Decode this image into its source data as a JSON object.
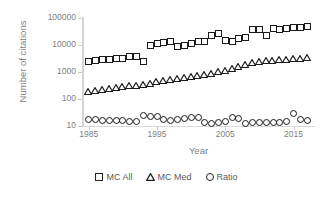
{
  "chart_data": {
    "type": "scatter",
    "title": "",
    "xlabel": "Year",
    "ylabel": "Number of citations",
    "yscale": "log",
    "ylim": [
      10,
      100000
    ],
    "xlim": [
      1984,
      2018
    ],
    "grid": false,
    "legend_position": "bottom",
    "y_ticks": [
      "10",
      "100",
      "1000",
      "10000",
      "100000"
    ],
    "y_tick_values": [
      10,
      100,
      1000,
      10000,
      100000
    ],
    "x_ticks": [
      "1985",
      "1995",
      "2005",
      "2015"
    ],
    "x_tick_values": [
      1985,
      1995,
      2005,
      2015
    ],
    "x": [
      1985,
      1986,
      1987,
      1988,
      1989,
      1990,
      1991,
      1992,
      1993,
      1994,
      1995,
      1996,
      1997,
      1998,
      1999,
      2000,
      2001,
      2002,
      2003,
      2004,
      2005,
      2006,
      2007,
      2008,
      2009,
      2010,
      2011,
      2012,
      2013,
      2014,
      2015,
      2016,
      2017
    ],
    "series": [
      {
        "name": "MC All",
        "marker": "square",
        "values": [
          2400,
          2700,
          2800,
          3000,
          3100,
          3300,
          3600,
          3800,
          2500,
          10000,
          11000,
          12000,
          13000,
          8500,
          9500,
          11000,
          13000,
          14000,
          22000,
          26000,
          15000,
          14000,
          17000,
          19000,
          36000,
          38000,
          23000,
          40000,
          38000,
          42000,
          44000,
          45000,
          48000
        ]
      },
      {
        "name": "MC Med",
        "marker": "triangle",
        "values": [
          140,
          155,
          175,
          185,
          200,
          215,
          235,
          250,
          270,
          300,
          330,
          360,
          400,
          440,
          480,
          520,
          560,
          620,
          700,
          780,
          900,
          1000,
          1200,
          1400,
          1700,
          1900,
          2000,
          2100,
          2200,
          2300,
          2400,
          2500,
          2600
        ]
      },
      {
        "name": "Ratio",
        "marker": "circle",
        "values": [
          17,
          17,
          16,
          16,
          16,
          16,
          15,
          15,
          24,
          23,
          22,
          17,
          16,
          18,
          19,
          20,
          20,
          13,
          12,
          13,
          15,
          20,
          19,
          12,
          13,
          13,
          14,
          14,
          14,
          15,
          28,
          18,
          16
        ]
      }
    ]
  },
  "legend": {
    "items": [
      {
        "label": "MC All",
        "marker": "square"
      },
      {
        "label": "MC Med",
        "marker": "triangle"
      },
      {
        "label": "Ratio",
        "marker": "circle"
      }
    ]
  }
}
